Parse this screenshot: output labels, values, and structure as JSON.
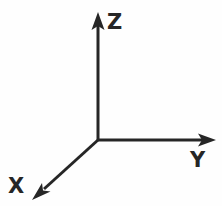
{
  "figure": {
    "name": "3d-cartesian-axes",
    "background_color": "#fefefe",
    "stroke_color": "#262626",
    "stroke_width": 3,
    "width": 222,
    "height": 206,
    "origin": {
      "x": 98,
      "y": 140
    }
  },
  "axes": [
    {
      "id": "z-axis",
      "label": "Z",
      "direction": "up",
      "line": {
        "x1": 98,
        "y1": 140,
        "x2": 98,
        "y2": 22
      },
      "arrowhead": {
        "tip_x": 98,
        "tip_y": 13
      },
      "label_position": {
        "x": 107,
        "y": 12
      }
    },
    {
      "id": "y-axis",
      "label": "Y",
      "direction": "right",
      "line": {
        "x1": 98,
        "y1": 140,
        "x2": 205,
        "y2": 140
      },
      "arrowhead": {
        "tip_x": 214,
        "tip_y": 140
      },
      "label_position": {
        "x": 190,
        "y": 150
      }
    },
    {
      "id": "x-axis",
      "label": "X",
      "direction": "down-left",
      "line": {
        "x1": 98,
        "y1": 140,
        "x2": 43,
        "y2": 190
      },
      "arrowhead": {
        "tip_x": 33,
        "tip_y": 199
      },
      "label_position": {
        "x": 8,
        "y": 176
      }
    }
  ],
  "labels": {
    "z": "Z",
    "y": "Y",
    "x": "X"
  }
}
